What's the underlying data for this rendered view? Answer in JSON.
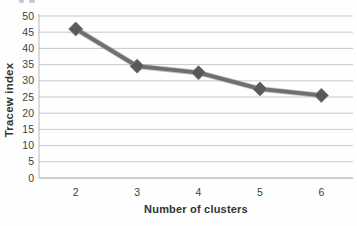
{
  "figure": {
    "background": "#fefefe",
    "cropped_label_fragment": "partial glyph bottoms cut off at top edge"
  },
  "chart_data": {
    "type": "line",
    "title": "",
    "xlabel": "Number of clusters",
    "ylabel": "Tracew index",
    "categories": [
      "2",
      "3",
      "4",
      "5",
      "6"
    ],
    "series": [
      {
        "name": "Tracew index",
        "values": [
          46,
          34.5,
          32.5,
          27.5,
          25.5
        ]
      }
    ],
    "ylim": [
      0,
      50
    ],
    "ytick_step": 5,
    "ytick_labels": [
      "0",
      "5",
      "10",
      "15",
      "20",
      "25",
      "30",
      "35",
      "40",
      "45",
      "50"
    ],
    "grid": "horizontal",
    "legend": "none",
    "marker": "diamond",
    "colors": {
      "line": "#6e6e6e",
      "line_highlight": "#8d8d8d",
      "marker_fill": "#595959",
      "marker_edge": "#7c7c7c",
      "gridline": "#c9c9c9",
      "axis_line_x": "#a0a0a0",
      "axis_line_y": "#b8b8b8",
      "tick_label": "#3f3f3f",
      "axis_title": "#333333"
    }
  }
}
